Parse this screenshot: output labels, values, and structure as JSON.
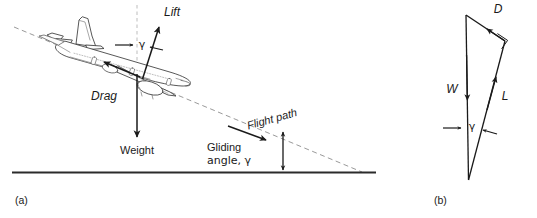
{
  "figure": {
    "title_a": "(a)",
    "title_b": "(b)",
    "subfigure_a": {
      "name": "aircraft-gliding-free-body-diagram",
      "labels": {
        "lift": "Lift",
        "drag": "Drag",
        "weight": "Weight",
        "flight_path": "Flight path",
        "gliding_angle_line1": "Gliding",
        "gliding_angle_line2": "angle, γ",
        "gamma": "γ"
      }
    },
    "subfigure_b": {
      "name": "force-triangle-diagram",
      "labels": {
        "drag": "D",
        "weight": "W",
        "lift": "L",
        "gamma": "γ"
      }
    },
    "colors": {
      "ink": "#1a1a1a",
      "ground": "#2b2b2b",
      "dashed": "#9a9a9a",
      "aircraft_outline": "#3a3a3a",
      "fill": "#ffffff"
    }
  }
}
